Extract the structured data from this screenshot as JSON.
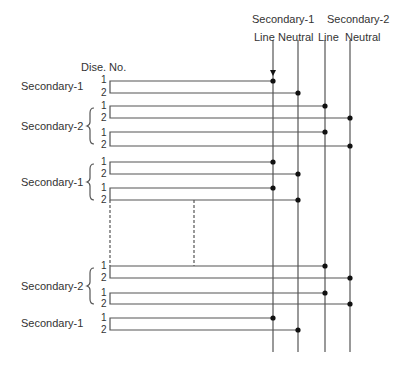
{
  "header": {
    "secondary1": "Secondary-1",
    "secondary2": "Secondary-2",
    "line1": "Line",
    "neutral1": "Neutral",
    "line2": "Line",
    "neutral2": "Neutral"
  },
  "column_label": "Dise. No.",
  "groups": [
    {
      "label": "Secondary-1",
      "numbers": [
        "1",
        "2"
      ]
    },
    {
      "label": "Secondary-2",
      "numbers": [
        "1",
        "2",
        "1",
        "2"
      ]
    },
    {
      "label": "Secondary-1",
      "numbers": [
        "1",
        "2",
        "1",
        "2"
      ]
    },
    {
      "label": "Secondary-2",
      "numbers": [
        "1",
        "2",
        "1",
        "2"
      ]
    },
    {
      "label": "Secondary-1",
      "numbers": [
        "1",
        "2"
      ]
    }
  ],
  "colors": {
    "line": "#555555",
    "dot": "#111111"
  }
}
